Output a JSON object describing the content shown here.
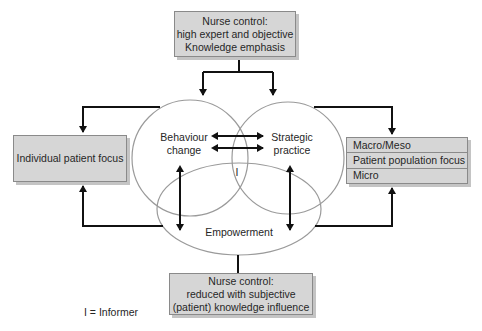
{
  "diagram": {
    "top_box": {
      "lines": [
        "Nurse control:",
        "high expert and objective",
        "Knowledge emphasis"
      ]
    },
    "left_box": {
      "label": "Individual patient focus"
    },
    "right_box": {
      "rows": [
        "Macro/Meso",
        "Patient population focus",
        "Micro"
      ]
    },
    "bottom_box": {
      "lines": [
        "Nurse control:",
        "reduced with subjective",
        "(patient) knowledge influence"
      ]
    },
    "circles": {
      "left": [
        "Behaviour",
        "change"
      ],
      "right": [
        "Strategic",
        "practice"
      ],
      "ellipse": "Empowerment",
      "intersection": "I"
    },
    "legend": "I = Informer",
    "colors": {
      "box_fill": "#d6d6d6",
      "box_border": "#8a8a8a",
      "line": "#111111",
      "circle": "#9a9a9a"
    }
  }
}
